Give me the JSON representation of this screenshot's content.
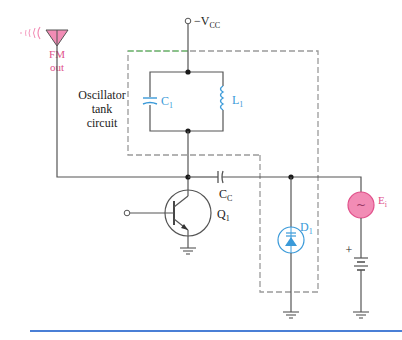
{
  "figure": {
    "type": "circuit-schematic"
  },
  "labels": {
    "antenna": {
      "line1": "FM",
      "line2": "out"
    },
    "supply": {
      "prefix": "−V",
      "sub": "CC"
    },
    "tank": {
      "line1": "Oscillator",
      "line2": "tank",
      "line3": "circuit"
    },
    "c1": {
      "main": "C",
      "sub": "1"
    },
    "l1": {
      "main": "L",
      "sub": "1"
    },
    "cc": {
      "main": "C",
      "sub": "C"
    },
    "q1": {
      "main": "Q",
      "sub": "1"
    },
    "d1": {
      "main": "D",
      "sub": "1"
    },
    "e1": {
      "main": "E",
      "sub": "i"
    },
    "ac_symbol": "~",
    "battery_plus": "+"
  },
  "colors": {
    "wire": "#555555",
    "dashed_box": "#9a9a9a",
    "dashed_box_top_accent": "#7fc77f",
    "blue_components": "#3a9ad9",
    "pink_components": "#e0508a",
    "pink_fill": "#f28cb5",
    "bottom_rule": "#4a7fd6"
  },
  "components": [
    {
      "id": "antenna",
      "kind": "antenna"
    },
    {
      "id": "C1",
      "kind": "capacitor"
    },
    {
      "id": "L1",
      "kind": "inductor"
    },
    {
      "id": "CC",
      "kind": "coupling-capacitor"
    },
    {
      "id": "Q1",
      "kind": "npn-transistor"
    },
    {
      "id": "D1",
      "kind": "varactor-diode"
    },
    {
      "id": "Ei",
      "kind": "ac-source"
    },
    {
      "id": "battery",
      "kind": "dc-bias"
    }
  ]
}
